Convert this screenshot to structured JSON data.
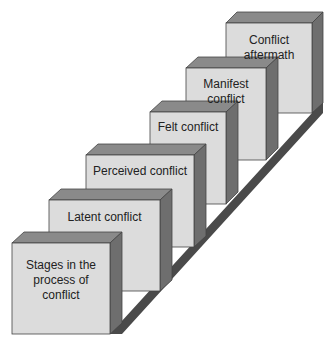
{
  "diagram": {
    "title": "Stages in the process of conflict",
    "stages": [
      {
        "label": "Stages in the process of conflict",
        "lines": [
          "Stages in the",
          "process of",
          "conflict"
        ]
      },
      {
        "label": "Latent conflict"
      },
      {
        "label": "Perceived conflict"
      },
      {
        "label": "Felt conflict"
      },
      {
        "label": "Manifest conflict"
      },
      {
        "label": "Conflict aftermath"
      }
    ],
    "colors": {
      "front": "#dcdcdc",
      "top": "#8a8a8a",
      "side": "#6e6e6e",
      "shadow": "#4a4a4a",
      "outline": "#444444"
    }
  }
}
